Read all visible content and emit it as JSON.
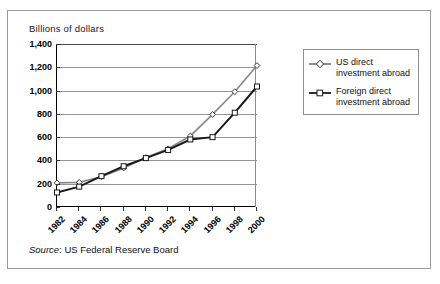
{
  "figure": {
    "axis_title": "Billions of dollars",
    "source_prefix": "Source",
    "source_separator": ":",
    "source_text": "US Federal Reserve Board"
  },
  "legend": {
    "items": [
      {
        "label_line1": "US direct",
        "label_line2": "investment abroad",
        "marker": "diamond-marker-icon",
        "color": "#8a8a8a"
      },
      {
        "label_line1": "Foreign direct",
        "label_line2": "investment abroad",
        "marker": "square-marker-icon",
        "color": "#1a1a1a"
      }
    ]
  },
  "chart_data": {
    "type": "line",
    "title": "",
    "xlabel": "",
    "ylabel": "Billions of dollars",
    "categories": [
      "1982",
      "1983",
      "1984",
      "1985",
      "1986",
      "1987",
      "1988",
      "1989",
      "1990",
      "1991",
      "1992",
      "1993",
      "1994",
      "1995",
      "1996",
      "1997",
      "1998",
      "1999",
      "2000"
    ],
    "tick_categories": [
      "1982",
      "1984",
      "1986",
      "1988",
      "1990",
      "1992",
      "1994",
      "1996",
      "1998",
      "2000"
    ],
    "ylim": [
      0,
      1400
    ],
    "yticks": [
      0,
      200,
      400,
      600,
      800,
      1000,
      1200,
      1400
    ],
    "ytick_labels": [
      "0",
      "200",
      "400",
      "600",
      "800",
      "1,000",
      "1,200",
      "1,400"
    ],
    "grid": true,
    "legend_position": "right",
    "series": [
      {
        "name": "US direct investment abroad",
        "color": "#8a8a8a",
        "marker": "diamond",
        "x": [
          "1982",
          "1984",
          "1986",
          "1988",
          "1990",
          "1992",
          "1994",
          "1996",
          "1998",
          "2000"
        ],
        "values": [
          207,
          212,
          260,
          335,
          425,
          500,
          610,
          795,
          990,
          1215
        ]
      },
      {
        "name": "Foreign direct investment abroad",
        "color": "#1a1a1a",
        "marker": "square",
        "x": [
          "1982",
          "1984",
          "1986",
          "1988",
          "1990",
          "1992",
          "1994",
          "1996",
          "1998",
          "2000"
        ],
        "values": [
          125,
          175,
          265,
          350,
          420,
          490,
          580,
          600,
          810,
          1035
        ]
      }
    ]
  }
}
